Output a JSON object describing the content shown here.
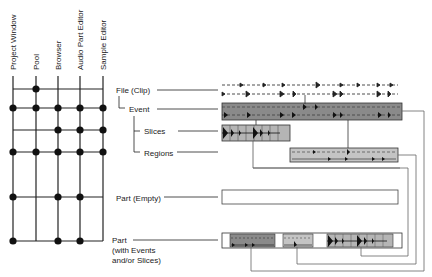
{
  "columns": [
    {
      "label": "Project Window",
      "x": 13
    },
    {
      "label": "Pool",
      "x": 36
    },
    {
      "label": "Browser",
      "x": 58
    },
    {
      "label": "Audio Part Editor",
      "x": 80
    },
    {
      "label": "Sample Editor",
      "x": 103
    }
  ],
  "rows": [
    {
      "label": "File (Clip)",
      "y": 89,
      "dots": [
        false,
        true,
        false,
        false,
        false
      ]
    },
    {
      "label": "Event",
      "y": 108,
      "dots": [
        true,
        true,
        true,
        true,
        true
      ]
    },
    {
      "label": "Slices",
      "y": 130,
      "dots": [
        false,
        false,
        true,
        true,
        true
      ]
    },
    {
      "label": "Regions",
      "y": 152,
      "dots": [
        true,
        true,
        true,
        true,
        true
      ]
    },
    {
      "label": "Part (Empty)",
      "y": 197,
      "dots": [
        true,
        false,
        true,
        true,
        false
      ]
    },
    {
      "label": "Part",
      "label2": "(with Events",
      "label3": "and/or Slices)",
      "y": 241,
      "dots": [
        true,
        false,
        true,
        true,
        false
      ]
    }
  ],
  "colors": {
    "line": "#222222",
    "event_fill": "#8a8a8a",
    "slice_fill": "#b5b5b5",
    "region_fill": "#c4c4c4",
    "connector": "#555555"
  }
}
